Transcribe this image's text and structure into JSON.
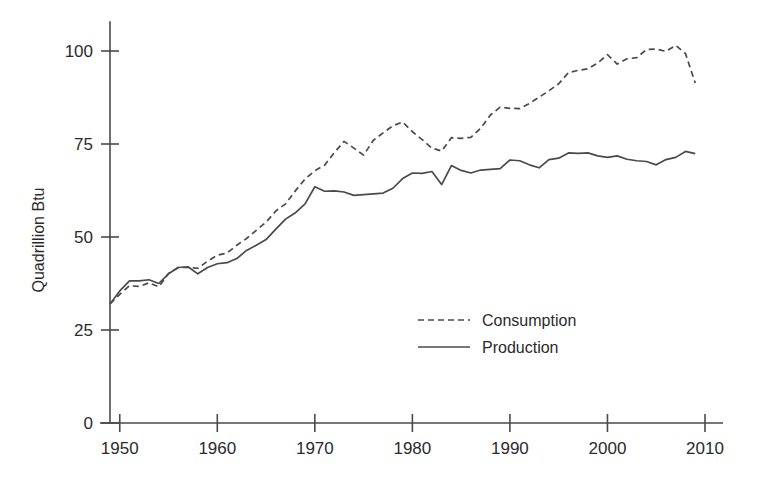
{
  "chart_data": {
    "type": "line",
    "title": "",
    "xlabel": "",
    "ylabel": "Quadrillion Btu",
    "xlim": [
      1949,
      2010
    ],
    "ylim": [
      0,
      108
    ],
    "grid": false,
    "legend_position": "center",
    "x_ticks": [
      "1950",
      "1960",
      "1970",
      "1980",
      "1990",
      "2000",
      "2010"
    ],
    "x_tick_values": [
      1950,
      1960,
      1970,
      1980,
      1990,
      2000,
      2010
    ],
    "y_ticks": [
      "0",
      "25",
      "50",
      "75",
      "100"
    ],
    "y_tick_values": [
      0,
      25,
      50,
      75,
      100
    ],
    "x": [
      1949,
      1950,
      1951,
      1952,
      1953,
      1954,
      1955,
      1956,
      1957,
      1958,
      1959,
      1960,
      1961,
      1962,
      1963,
      1964,
      1965,
      1966,
      1967,
      1968,
      1969,
      1970,
      1971,
      1972,
      1973,
      1974,
      1975,
      1976,
      1977,
      1978,
      1979,
      1980,
      1981,
      1982,
      1983,
      1984,
      1985,
      1986,
      1987,
      1988,
      1989,
      1990,
      1991,
      1992,
      1993,
      1994,
      1995,
      1996,
      1997,
      1998,
      1999,
      2000,
      2001,
      2002,
      2003,
      2004,
      2005,
      2006,
      2007,
      2008,
      2009
    ],
    "series": [
      {
        "name": "Consumption",
        "style": "dashed",
        "color": "#4a4a4a",
        "values": [
          32.0,
          34.6,
          36.9,
          36.7,
          37.7,
          36.6,
          40.2,
          41.8,
          41.8,
          41.6,
          43.5,
          45.1,
          45.7,
          47.8,
          49.6,
          51.8,
          54.0,
          57.0,
          58.9,
          62.4,
          65.6,
          67.8,
          69.3,
          72.7,
          75.7,
          73.9,
          72.0,
          76.0,
          78.0,
          79.9,
          80.9,
          78.3,
          76.2,
          73.9,
          73.1,
          76.7,
          76.5,
          76.8,
          79.2,
          82.8,
          84.9,
          84.6,
          84.5,
          85.9,
          87.6,
          89.3,
          91.2,
          94.2,
          94.8,
          95.2,
          96.8,
          99.0,
          96.5,
          97.9,
          98.2,
          100.4,
          100.5,
          99.9,
          101.5,
          99.3,
          91.4
        ]
      },
      {
        "name": "Production",
        "style": "solid",
        "color": "#4a4a4a",
        "values": [
          32.0,
          35.5,
          38.2,
          38.2,
          38.5,
          37.5,
          40.1,
          41.8,
          42.0,
          40.1,
          41.8,
          42.8,
          43.1,
          44.2,
          46.4,
          47.8,
          49.3,
          52.1,
          54.8,
          56.5,
          58.9,
          63.5,
          62.3,
          62.4,
          62.1,
          61.2,
          61.4,
          61.6,
          61.8,
          63.1,
          65.7,
          67.2,
          67.1,
          67.6,
          64.1,
          69.2,
          67.9,
          67.2,
          68.0,
          68.2,
          68.4,
          70.7,
          70.5,
          69.4,
          68.6,
          70.8,
          71.2,
          72.6,
          72.5,
          72.6,
          71.8,
          71.4,
          71.8,
          70.9,
          70.5,
          70.3,
          69.4,
          70.8,
          71.4,
          73.0,
          72.4
        ]
      }
    ]
  },
  "legend": {
    "items": [
      {
        "label": "Consumption",
        "style": "dashed"
      },
      {
        "label": "Production",
        "style": "solid"
      }
    ]
  },
  "axes": {
    "y_title": "Quadrillion Btu"
  }
}
